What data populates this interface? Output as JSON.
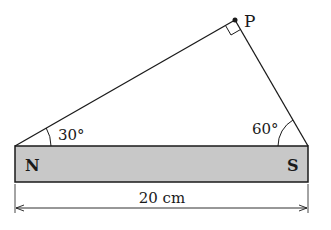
{
  "diagram": {
    "type": "geometry-magnet-triangle",
    "point_label": "P",
    "angle_left": "30°",
    "angle_right": "60°",
    "pole_left": "N",
    "pole_right": "S",
    "dimension_label": "20 cm",
    "colors": {
      "magnet_fill": "#c8c8c8",
      "line": "#1a1a1a",
      "background": "#ffffff"
    }
  }
}
